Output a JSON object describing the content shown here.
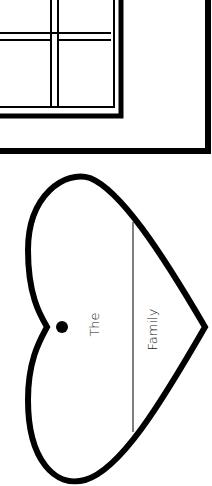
{
  "document": {
    "type": "printable worksheet (rotated)",
    "heart_label": {
      "prefix": "The",
      "suffix": "Family",
      "blank_line": true
    }
  },
  "colors": {
    "ink": "#000000",
    "paper": "#ffffff"
  }
}
